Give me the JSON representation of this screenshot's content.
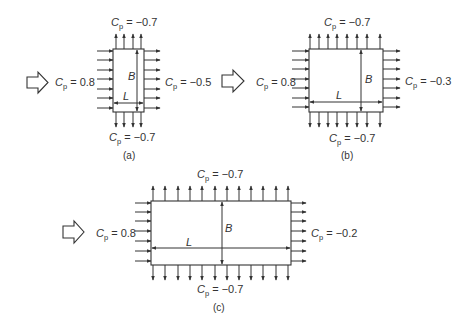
{
  "figure": {
    "panels": [
      {
        "id": "a",
        "caption": "(a)",
        "windward": {
          "symbol": "C",
          "subscript": "p",
          "eq": " = 0.8"
        },
        "leeward": {
          "symbol": "C",
          "subscript": "p",
          "eq": " = −0.5"
        },
        "top": {
          "symbol": "C",
          "subscript": "p",
          "eq": " = −0.7"
        },
        "bottom": {
          "symbol": "C",
          "subscript": "p",
          "eq": " = −0.7"
        },
        "dim_B": "B",
        "dim_L": "L",
        "rect": {
          "x": 113,
          "y": 49,
          "w": 31,
          "h": 63
        },
        "arrows_top": 4,
        "arrows_side": 7
      },
      {
        "id": "b",
        "caption": "(b)",
        "windward": {
          "symbol": "C",
          "subscript": "p",
          "eq": " = 0.8"
        },
        "leeward": {
          "symbol": "C",
          "subscript": "p",
          "eq": " = −0.3"
        },
        "top": {
          "symbol": "C",
          "subscript": "p",
          "eq": " = −0.7"
        },
        "bottom": {
          "symbol": "C",
          "subscript": "p",
          "eq": " = −0.7"
        },
        "dim_B": "B",
        "dim_L": "L",
        "rect": {
          "x": 309,
          "y": 49,
          "w": 74,
          "h": 63
        },
        "arrows_top": 8,
        "arrows_side": 7
      },
      {
        "id": "c",
        "caption": "(c)",
        "windward": {
          "symbol": "C",
          "subscript": "p",
          "eq": " = 0.8"
        },
        "leeward": {
          "symbol": "C",
          "subscript": "p",
          "eq": " = −0.2"
        },
        "top": {
          "symbol": "C",
          "subscript": "p",
          "eq": " = −0.7"
        },
        "bottom": {
          "symbol": "C",
          "subscript": "p",
          "eq": " = −0.7"
        },
        "dim_B": "B",
        "dim_L": "L",
        "rect": {
          "x": 151,
          "y": 201,
          "w": 140,
          "h": 64
        },
        "arrows_top": 12,
        "arrows_side": 7
      }
    ],
    "icons": {
      "wind": "hollow-right-arrow-icon"
    },
    "colors": {
      "ink": "#333333",
      "background": "#ffffff"
    }
  }
}
